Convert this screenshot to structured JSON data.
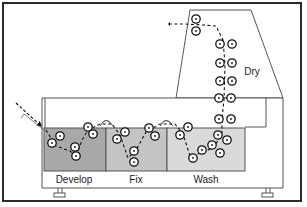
{
  "diagram": {
    "type": "film processor cross-section",
    "stages": [
      {
        "id": "develop",
        "label": "Develop",
        "color": "#a9a9a9"
      },
      {
        "id": "fix",
        "label": "Fix",
        "color": "#c4c4c4"
      },
      {
        "id": "wash",
        "label": "Wash",
        "color": "#dadada"
      },
      {
        "id": "dry",
        "label": "Dry",
        "color": "#ffffff"
      }
    ],
    "colors": {
      "outline": "#555555",
      "frame": "#2a2a2a",
      "roller": "#111111",
      "path": "#111111"
    }
  }
}
